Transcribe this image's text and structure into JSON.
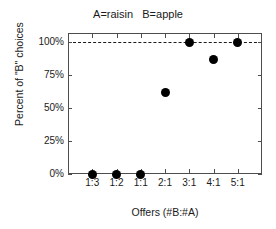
{
  "chart_data": {
    "type": "scatter",
    "title": "A=raisin   B=apple",
    "xlabel": "Offers (#B:#A)",
    "ylabel": "Percent of \"B\" choices",
    "categories": [
      "1:3",
      "1:2",
      "1:1",
      "2:1",
      "3:1",
      "4:1",
      "5:1"
    ],
    "values": [
      0,
      0,
      0,
      62,
      100,
      87,
      100
    ],
    "ytick_labels": [
      "0%",
      "25%",
      "50%",
      "75%",
      "100%"
    ],
    "ytick_values": [
      0,
      25,
      50,
      75,
      100
    ],
    "ylim": [
      0,
      107
    ],
    "xlim": [
      0,
      8
    ],
    "grid": false,
    "legend": null,
    "annotations": [
      {
        "name": "reference-line",
        "type": "horizontal-dashed-line",
        "value": 100,
        "color": "#1a1a1a"
      }
    ],
    "marker": {
      "shape": "circle",
      "color": "#000000",
      "size_px": 9
    },
    "axis_color": "#4d4d4d"
  }
}
